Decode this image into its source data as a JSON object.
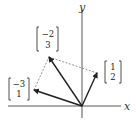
{
  "diagram": {
    "type": "vector-addition",
    "axes": {
      "x_label": "x",
      "y_label": "y"
    },
    "vectors": [
      {
        "name": "u",
        "components": [
          "1",
          "2"
        ],
        "top": "1",
        "bottom": "2"
      },
      {
        "name": "v",
        "components": [
          "-3",
          "1"
        ],
        "top": "−3",
        "bottom": "1"
      },
      {
        "name": "sum",
        "components": [
          "-2",
          "3"
        ],
        "top": "−2",
        "bottom": "3"
      }
    ],
    "colors": {
      "ink": "#222222",
      "dashed": "#555555",
      "background": "#ffffff"
    }
  }
}
